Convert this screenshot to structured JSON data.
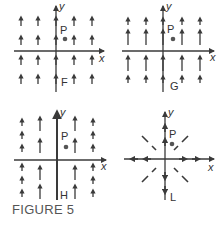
{
  "figure": {
    "caption": "FIGURE 5",
    "ink_color": "#3a3a3a",
    "point_color": "#555555",
    "panels": [
      {
        "id": "F",
        "label": "F",
        "x_label": "x",
        "y_label": "y",
        "point_label": "P",
        "description": "Uniform vertical field: all arrows point up with equal short length",
        "origin": [
          56,
          51
        ],
        "point": [
          65,
          39
        ],
        "field_type": "uniform-up-short"
      },
      {
        "id": "G",
        "label": "G",
        "x_label": "x",
        "y_label": "y",
        "point_label": "P",
        "description": "Vertical upward field; arrows longer near x-axis rows, shorter at outer rows",
        "origin": [
          163,
          51
        ],
        "point": [
          173,
          39
        ],
        "field_type": "up-length-varies-with-y"
      },
      {
        "id": "H",
        "label": "H",
        "x_label": "x",
        "y_label": "y",
        "point_label": "P",
        "description": "Vertical upward field; arrows longer near y-axis columns, shorter farther out",
        "origin": [
          57,
          160
        ],
        "point": [
          66,
          147
        ],
        "field_type": "up-length-varies-with-x"
      },
      {
        "id": "L",
        "label": "L",
        "x_label": "x",
        "y_label": "y",
        "point_label": "P",
        "description": "Radial field pointing outward from the origin",
        "origin": [
          165,
          160
        ],
        "point": [
          173,
          145
        ],
        "field_type": "radial-outward"
      }
    ]
  }
}
